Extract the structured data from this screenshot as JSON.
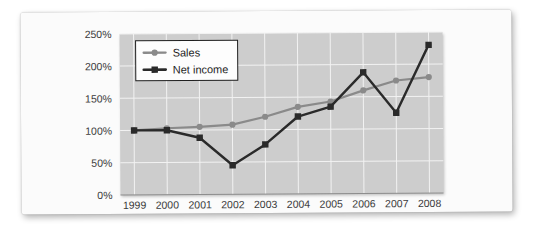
{
  "chart_data": {
    "type": "line",
    "title": "",
    "xlabel": "",
    "ylabel": "",
    "categories": [
      "1999",
      "2000",
      "2001",
      "2002",
      "2003",
      "2004",
      "2005",
      "2006",
      "2007",
      "2008"
    ],
    "x_tick_labels": [
      "1999",
      "2000",
      "2001",
      "2002",
      "2003",
      "2004",
      "2005",
      "2006",
      "2007",
      "2008"
    ],
    "y_tick_labels": [
      "0%",
      "50%",
      "100%",
      "150%",
      "200%",
      "250%"
    ],
    "y_tick_values": [
      0,
      50,
      100,
      150,
      200,
      250
    ],
    "ylim": [
      0,
      250
    ],
    "y_unit": "%",
    "grid": true,
    "legend_position": "top-left-inside",
    "series": [
      {
        "name": "Sales",
        "color": "#8a8a8a",
        "marker": "circle",
        "values": [
          100,
          103,
          105,
          108,
          120,
          135,
          143,
          160,
          175,
          180
        ]
      },
      {
        "name": "Net income",
        "color": "#2a2a2a",
        "marker": "square",
        "values": [
          100,
          100,
          88,
          45,
          77,
          120,
          135,
          188,
          125,
          230
        ]
      }
    ]
  },
  "legend": {
    "entries": [
      {
        "label": "Sales"
      },
      {
        "label": "Net income"
      }
    ]
  },
  "colors": {
    "sales": "#8a8a8a",
    "net_income": "#2a2a2a",
    "plot_background": "#cdcdcd",
    "gridline": "#f2f2f2",
    "card_background": "#fbfbfb",
    "page_background": "#ffffff"
  }
}
